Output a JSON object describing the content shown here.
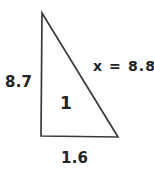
{
  "figure": {
    "type": "right-triangle-diagram",
    "background_color": "#ffffff",
    "stroke_color": "#3a3a3a",
    "text_color": "#232323",
    "labels": {
      "left_leg": "8.7",
      "hypotenuse": "x = 8.8",
      "interior": "1",
      "base": "1.6"
    },
    "geometry": {
      "apex": [
        42,
        13
      ],
      "bottom_left": [
        41,
        136
      ],
      "bottom_right": [
        118,
        137
      ]
    },
    "values": {
      "left_leg_length": 8.7,
      "base_length": 1.6,
      "hypotenuse_variable": "x",
      "hypotenuse_length": 8.8,
      "interior_marker": 1
    }
  }
}
